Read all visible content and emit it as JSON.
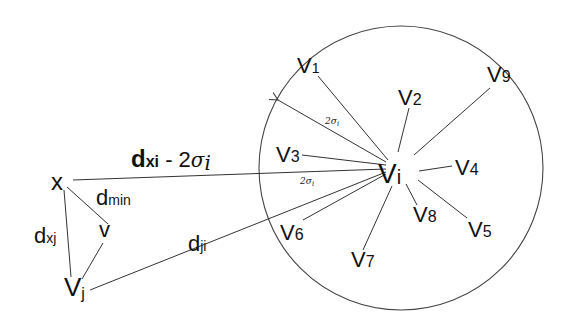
{
  "diagram": {
    "center_node": {
      "label": "V",
      "sub": "i"
    },
    "query_node": {
      "label": "x"
    },
    "other_nodes": [
      {
        "id": "v",
        "label": "v",
        "sub": ""
      },
      {
        "id": "vj",
        "label": "V",
        "sub": "j"
      }
    ],
    "neighbors": [
      {
        "label": "V",
        "sub": "1"
      },
      {
        "label": "V",
        "sub": "2"
      },
      {
        "label": "V",
        "sub": "3"
      },
      {
        "label": "V",
        "sub": "4"
      },
      {
        "label": "V",
        "sub": "5"
      },
      {
        "label": "V",
        "sub": "6"
      },
      {
        "label": "V",
        "sub": "7"
      },
      {
        "label": "V",
        "sub": "8"
      },
      {
        "label": "V",
        "sub": "9"
      }
    ],
    "edge_labels": {
      "dxi_main": "d",
      "dxi_sub": "xi",
      "dxi_suffix": " - 2",
      "sigma": "σ",
      "sigma_sub": "i",
      "radius_label": "2σ",
      "radius_sub": "i",
      "dmin_main": "d",
      "dmin_sub": "min",
      "dxj_main": "d",
      "dxj_sub": "xj",
      "dji_main": "d",
      "dji_sub": "ji"
    },
    "circle": {
      "cx": 401,
      "cy": 168,
      "r": 142,
      "stroke": "#444444"
    }
  }
}
